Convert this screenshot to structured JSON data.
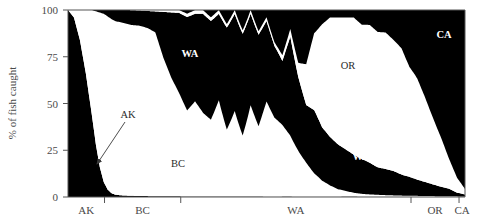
{
  "chart_data": {
    "type": "area",
    "title": "",
    "subtitle": "",
    "xlabel": "",
    "ylabel": "% of fish caught",
    "ylim": [
      0,
      100
    ],
    "xlim": [
      0,
      100
    ],
    "grid": false,
    "legend_position": "inline-labels",
    "stacked": true,
    "normalized_percent": true,
    "y_ticks": [
      "0",
      "25",
      "50",
      "75",
      "100"
    ],
    "y_tick_values": [
      0,
      25,
      50,
      75,
      100
    ],
    "x_tick_labels": [
      "AK",
      "BC",
      "WA",
      "OR",
      "CA"
    ],
    "x_tick_boundaries": [
      0,
      9.2,
      28.4,
      86.4,
      98.5,
      100
    ],
    "x_axis_note": "catch-region zones along the coast, AK (north) to CA (south)",
    "series_order": [
      "AK",
      "BC",
      "WA",
      "OR",
      "CA"
    ],
    "series": [
      {
        "name": "AK",
        "fill": "#000000",
        "x": [
          0,
          1.5,
          3,
          4.5,
          6,
          7,
          8,
          9,
          10,
          11,
          12,
          14,
          18,
          24,
          30,
          40,
          50,
          60,
          70,
          80,
          90,
          100
        ],
        "values": [
          100,
          96,
          84,
          66,
          44,
          28,
          16,
          8,
          4,
          2,
          1.2,
          0.8,
          0.5,
          0.4,
          0.3,
          0.3,
          0.2,
          0.2,
          0.2,
          0.2,
          0.1,
          0.1
        ]
      },
      {
        "name": "BC",
        "fill": "#ffffff",
        "x": [
          0,
          1.5,
          3,
          4.5,
          6,
          7,
          8,
          9,
          10,
          11,
          12,
          14,
          16,
          18,
          20,
          22,
          24,
          26,
          28,
          30,
          32,
          34,
          36,
          38,
          40,
          42,
          44,
          46,
          48,
          50,
          52,
          54,
          56,
          58,
          60,
          62,
          64,
          66,
          68,
          70,
          72,
          74,
          76,
          78,
          80,
          85,
          90,
          95,
          100
        ],
        "values": [
          0,
          4,
          16,
          34,
          56,
          70,
          82,
          90,
          94,
          94,
          93,
          93,
          92,
          90,
          89,
          86,
          73,
          62,
          54,
          46,
          50,
          44,
          42,
          50,
          38,
          44,
          36,
          48,
          40,
          52,
          44,
          38,
          32,
          26,
          20,
          14,
          9,
          6,
          4,
          3,
          2,
          1.5,
          1.2,
          1,
          0.8,
          0.5,
          0.4,
          0.3,
          0.2
        ]
      },
      {
        "name": "WA",
        "fill": "#000000",
        "x": [
          0,
          3,
          6,
          9,
          11,
          12,
          14,
          16,
          18,
          20,
          22,
          24,
          26,
          28,
          30,
          32,
          34,
          36,
          38,
          40,
          42,
          44,
          46,
          48,
          50,
          52,
          54,
          56,
          58,
          60,
          62,
          64,
          66,
          68,
          70,
          72,
          74,
          76,
          78,
          80,
          82,
          84,
          86,
          88,
          90,
          92,
          94,
          96,
          98,
          100
        ],
        "values": [
          0,
          0,
          0,
          2,
          5,
          6,
          7,
          8,
          8,
          9,
          11,
          24,
          34,
          42,
          50,
          46,
          52,
          54,
          45,
          58,
          50,
          60,
          48,
          52,
          44,
          40,
          34,
          52,
          42,
          34,
          38,
          30,
          26,
          24,
          22,
          20,
          19,
          17,
          15,
          14,
          13,
          11,
          10,
          8,
          7,
          6,
          5,
          4,
          2,
          1
        ]
      },
      {
        "name": "OR",
        "fill": "#ffffff",
        "x": [
          0,
          10,
          15,
          20,
          24,
          28,
          32,
          36,
          40,
          44,
          48,
          52,
          56,
          58,
          60,
          62,
          64,
          66,
          68,
          70,
          72,
          74,
          76,
          78,
          80,
          82,
          84,
          86,
          88,
          90,
          92,
          94,
          96,
          98,
          100
        ],
        "values": [
          0,
          0,
          0,
          0.5,
          1,
          1.5,
          2,
          2,
          2,
          2,
          2,
          2,
          4,
          8,
          24,
          46,
          58,
          64,
          68,
          70,
          72,
          73,
          74,
          74,
          73,
          70,
          66,
          58,
          50,
          42,
          34,
          26,
          16,
          8,
          3
        ]
      },
      {
        "name": "CA",
        "fill": "#000000",
        "x": [
          0,
          10,
          20,
          24,
          28,
          30,
          32,
          34,
          36,
          38,
          40,
          42,
          44,
          46,
          48,
          50,
          52,
          54,
          56,
          58,
          60,
          62,
          64,
          66,
          68,
          70,
          72,
          74,
          76,
          78,
          80,
          82,
          84,
          86,
          88,
          90,
          92,
          94,
          96,
          98,
          100
        ],
        "values": [
          0,
          0,
          0,
          0,
          0,
          2,
          0,
          0,
          4,
          0,
          8,
          0,
          12,
          0,
          12,
          4,
          18,
          24,
          10,
          30,
          32,
          14,
          8,
          4,
          4,
          4,
          4,
          8,
          8,
          12,
          12,
          16,
          20,
          30,
          34,
          44,
          56,
          68,
          80,
          90,
          96
        ]
      }
    ],
    "band_labels": [
      {
        "text": "AK",
        "x": 128,
        "y": 118,
        "style": "dark",
        "kind": "annotation"
      },
      {
        "text": "BC",
        "x": 178,
        "y": 167,
        "style": "dark",
        "kind": "band"
      },
      {
        "text": "WA",
        "x": 190,
        "y": 57,
        "style": "light",
        "kind": "band"
      },
      {
        "text": "OR",
        "x": 348,
        "y": 69,
        "style": "dark",
        "kind": "band"
      },
      {
        "text": "WA",
        "x": 361,
        "y": 160,
        "style": "light",
        "kind": "band"
      },
      {
        "text": "CA",
        "x": 444,
        "y": 38,
        "style": "light",
        "kind": "band"
      }
    ],
    "annotations": [
      {
        "name": "ak-pointer",
        "label": "AK",
        "from_x": 125,
        "from_y": 122,
        "to_x": 97,
        "to_y": 164
      }
    ]
  }
}
